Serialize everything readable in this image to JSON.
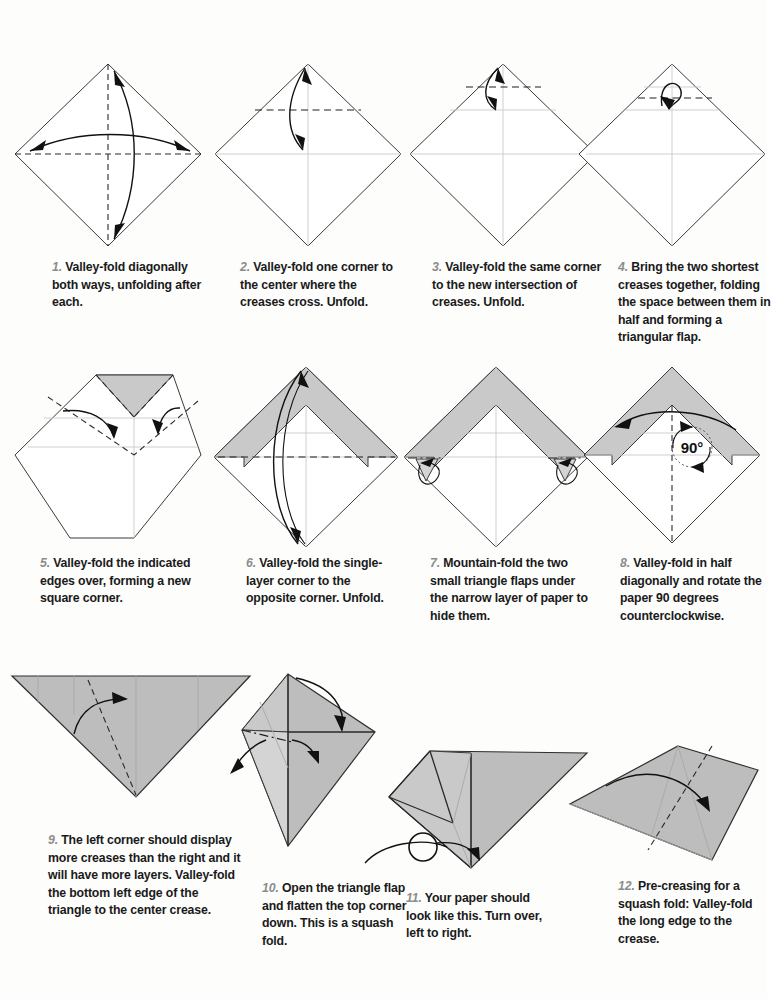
{
  "page": {
    "background_color": "#fdfdfc",
    "paper_fill_color": "#c9c9c9",
    "line_color": "#3b3b3b",
    "step_number_color": "#8c8c8c"
  },
  "rotation_label": "90°",
  "steps": [
    {
      "number": "1.",
      "text": " Valley-fold diagonally both ways, unfolding after each.",
      "diagram": "diamond with dashed vertical and horizontal creases and two double-headed curved arrows"
    },
    {
      "number": "2.",
      "text": " Valley-fold one corner to the center where the creases cross. Unfold.",
      "diagram": "diamond with dashed horizontal fold line at upper quarter and double-headed arrow from top vertex to center"
    },
    {
      "number": "3.",
      "text": " Valley-fold the same corner to the new intersection of creases. Unfold.",
      "diagram": "diamond with dashed horizontal fold line near top and double-headed arrow from top vertex down"
    },
    {
      "number": "4.",
      "text": " Bring the two shortest creases together, folding the space between them in half and forming a triangular flap.",
      "diagram": "diamond with dashed line near the top and a hooked curled arrow"
    },
    {
      "number": "5.",
      "text": " Valley-fold the indicated edges over, forming a new square corner.",
      "diagram": "flat-topped shape with gray triangular flap pointing down and two curved arrows over dashed diagonal creases"
    },
    {
      "number": "6.",
      "text": " Valley-fold the single-layer corner to the opposite corner. Unfold.",
      "diagram": "diamond with gray chevron band in the upper half, dashed horizontal midline and double-headed arrow top to bottom"
    },
    {
      "number": "7.",
      "text": " Mountain-fold the two small triangle flaps under the narrow layer of paper to hide them.",
      "diagram": "diamond with gray chevron band and two small side flaps with looping mountain-fold arrows"
    },
    {
      "number": "8.",
      "text": " Valley-fold in half diagonally and rotate the paper 90 degrees counterclockwise.",
      "diagram": "diamond with gray chevron band, dashed vertical centerline, sweeping arrow and a 90 degree rotation symbol"
    },
    {
      "number": "9.",
      "text": " The left corner should display more creases than the right and it will have more layers. Valley-fold the bottom left edge of the triangle to the center crease.",
      "diagram": "large gray downward-pointing triangle with dashed fold line and curved arrow to the right"
    },
    {
      "number": "10.",
      "text": " Open the triangle flap and flatten the top corner down. This is a squash fold.",
      "diagram": "angled gray form with dash-dot line, an arrow curving down over the top and two arrows opening to the sides"
    },
    {
      "number": "11.",
      "text": " Your paper should look like this. Turn over, left to right.",
      "diagram": "completed squash-folded gray shape with a turn-over loop arrow below"
    },
    {
      "number": "12.",
      "text": " Pre-creasing for a squash fold: Valley-fold the long edge to the crease.",
      "diagram": "flat gray kite shape with dashed fold line and a curved arrow sweeping right"
    }
  ]
}
